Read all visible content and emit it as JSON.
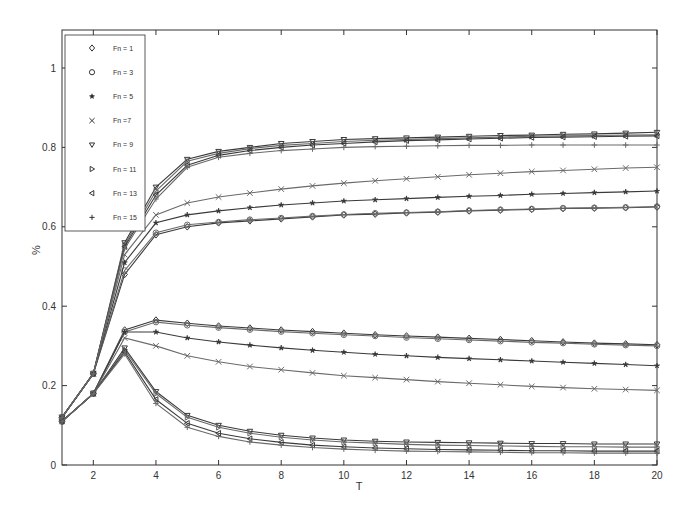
{
  "chart_data": {
    "type": "line",
    "title": "",
    "xlabel": "T",
    "ylabel": "%",
    "xlim": [
      1,
      20
    ],
    "ylim": [
      0,
      1.1
    ],
    "xticks": [
      2,
      4,
      6,
      8,
      10,
      12,
      14,
      16,
      18,
      20
    ],
    "yticks": [
      0,
      0.2,
      0.4,
      0.6,
      0.8,
      1
    ],
    "ytick_labels": [
      "0",
      "0.2",
      "0.4",
      "0.6",
      "0.8",
      "1"
    ],
    "grid": false,
    "legend_position": "top-left",
    "legend": [
      {
        "label": "Fn = 1",
        "marker": "diamond"
      },
      {
        "label": "Fn = 3",
        "marker": "circle"
      },
      {
        "label": "Fn = 5",
        "marker": "star"
      },
      {
        "label": "Fn =7",
        "marker": "x"
      },
      {
        "label": "Fn = 9",
        "marker": "triangle-down"
      },
      {
        "label": "Fn = 11",
        "marker": "triangle-right"
      },
      {
        "label": "Fn = 13",
        "marker": "triangle-left"
      },
      {
        "label": "Fn = 15",
        "marker": "plus"
      }
    ],
    "x": [
      1,
      2,
      3,
      4,
      5,
      6,
      7,
      8,
      9,
      10,
      11,
      12,
      13,
      14,
      15,
      16,
      17,
      18,
      19,
      20
    ],
    "series": [
      {
        "name": "Fn = 1 (upper)",
        "marker": "diamond",
        "values": [
          0.12,
          0.23,
          0.48,
          0.58,
          0.6,
          0.61,
          0.615,
          0.62,
          0.625,
          0.63,
          0.632,
          0.635,
          0.637,
          0.64,
          0.642,
          0.644,
          0.646,
          0.647,
          0.648,
          0.65
        ]
      },
      {
        "name": "Fn = 3 (upper)",
        "marker": "circle",
        "values": [
          0.12,
          0.23,
          0.49,
          0.585,
          0.605,
          0.612,
          0.618,
          0.622,
          0.627,
          0.631,
          0.634,
          0.636,
          0.638,
          0.641,
          0.643,
          0.645,
          0.647,
          0.648,
          0.649,
          0.651
        ]
      },
      {
        "name": "Fn = 5 (upper)",
        "marker": "star",
        "values": [
          0.12,
          0.23,
          0.51,
          0.61,
          0.63,
          0.64,
          0.648,
          0.655,
          0.66,
          0.665,
          0.668,
          0.671,
          0.674,
          0.677,
          0.679,
          0.682,
          0.684,
          0.686,
          0.688,
          0.69
        ]
      },
      {
        "name": "Fn =7 (upper)",
        "marker": "x",
        "values": [
          0.12,
          0.23,
          0.53,
          0.63,
          0.66,
          0.675,
          0.685,
          0.695,
          0.703,
          0.71,
          0.716,
          0.721,
          0.726,
          0.731,
          0.735,
          0.739,
          0.742,
          0.745,
          0.748,
          0.75
        ]
      },
      {
        "name": "Fn = 9 (upper)",
        "marker": "triangle-down",
        "values": [
          0.12,
          0.23,
          0.56,
          0.7,
          0.77,
          0.79,
          0.8,
          0.81,
          0.815,
          0.82,
          0.822,
          0.824,
          0.826,
          0.828,
          0.83,
          0.831,
          0.833,
          0.834,
          0.836,
          0.838
        ]
      },
      {
        "name": "Fn = 11 (upper)",
        "marker": "triangle-right",
        "values": [
          0.12,
          0.23,
          0.555,
          0.69,
          0.765,
          0.785,
          0.797,
          0.805,
          0.81,
          0.815,
          0.818,
          0.82,
          0.822,
          0.824,
          0.826,
          0.828,
          0.829,
          0.83,
          0.831,
          0.832
        ]
      },
      {
        "name": "Fn = 13 (upper)",
        "marker": "triangle-left",
        "values": [
          0.12,
          0.23,
          0.55,
          0.68,
          0.755,
          0.78,
          0.792,
          0.8,
          0.806,
          0.81,
          0.814,
          0.817,
          0.819,
          0.821,
          0.823,
          0.825,
          0.826,
          0.827,
          0.828,
          0.829
        ]
      },
      {
        "name": "Fn = 15 (upper)",
        "marker": "plus",
        "values": [
          0.12,
          0.23,
          0.545,
          0.67,
          0.75,
          0.775,
          0.785,
          0.792,
          0.796,
          0.8,
          0.802,
          0.803,
          0.804,
          0.805,
          0.805,
          0.806,
          0.806,
          0.806,
          0.806,
          0.806
        ]
      },
      {
        "name": "Fn = 1 (lower)",
        "marker": "diamond",
        "values": [
          0.11,
          0.18,
          0.34,
          0.365,
          0.357,
          0.35,
          0.345,
          0.34,
          0.336,
          0.332,
          0.328,
          0.325,
          0.322,
          0.319,
          0.316,
          0.313,
          0.31,
          0.307,
          0.305,
          0.303
        ]
      },
      {
        "name": "Fn = 3 (lower)",
        "marker": "circle",
        "values": [
          0.11,
          0.18,
          0.335,
          0.36,
          0.352,
          0.346,
          0.341,
          0.336,
          0.332,
          0.328,
          0.325,
          0.321,
          0.318,
          0.315,
          0.312,
          0.309,
          0.307,
          0.304,
          0.302,
          0.3
        ]
      },
      {
        "name": "Fn = 5 (lower)",
        "marker": "star",
        "values": [
          0.11,
          0.18,
          0.335,
          0.335,
          0.32,
          0.31,
          0.302,
          0.295,
          0.289,
          0.284,
          0.279,
          0.275,
          0.271,
          0.268,
          0.265,
          0.262,
          0.259,
          0.256,
          0.253,
          0.25
        ]
      },
      {
        "name": "Fn =7 (lower)",
        "marker": "x",
        "values": [
          0.11,
          0.18,
          0.32,
          0.3,
          0.275,
          0.26,
          0.248,
          0.24,
          0.232,
          0.225,
          0.22,
          0.215,
          0.21,
          0.206,
          0.202,
          0.198,
          0.195,
          0.192,
          0.19,
          0.188
        ]
      },
      {
        "name": "Fn = 9 (lower)",
        "marker": "triangle-down",
        "values": [
          0.11,
          0.18,
          0.295,
          0.185,
          0.125,
          0.1,
          0.085,
          0.075,
          0.068,
          0.063,
          0.06,
          0.058,
          0.057,
          0.056,
          0.055,
          0.054,
          0.054,
          0.053,
          0.053,
          0.053
        ]
      },
      {
        "name": "Fn = 11 (lower)",
        "marker": "triangle-right",
        "values": [
          0.11,
          0.18,
          0.29,
          0.18,
          0.12,
          0.095,
          0.08,
          0.07,
          0.063,
          0.058,
          0.055,
          0.052,
          0.05,
          0.049,
          0.048,
          0.047,
          0.046,
          0.046,
          0.045,
          0.045
        ]
      },
      {
        "name": "Fn = 13 (lower)",
        "marker": "triangle-left",
        "values": [
          0.11,
          0.18,
          0.285,
          0.165,
          0.105,
          0.08,
          0.066,
          0.057,
          0.05,
          0.046,
          0.043,
          0.041,
          0.039,
          0.038,
          0.037,
          0.036,
          0.036,
          0.035,
          0.035,
          0.035
        ]
      },
      {
        "name": "Fn = 15 (lower)",
        "marker": "plus",
        "values": [
          0.11,
          0.18,
          0.28,
          0.155,
          0.095,
          0.072,
          0.058,
          0.05,
          0.044,
          0.04,
          0.037,
          0.035,
          0.034,
          0.033,
          0.032,
          0.031,
          0.031,
          0.03,
          0.03,
          0.03
        ]
      }
    ],
    "colors": {
      "line": "#3a3a3a",
      "line_alt": "#6a6a6a",
      "axis": "#333333",
      "background": "#ffffff"
    }
  }
}
